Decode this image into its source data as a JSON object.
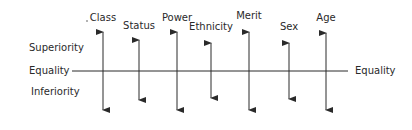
{
  "diagram": {
    "axis": {
      "left_labels": {
        "superiority": "Superiority",
        "equality": "Equality",
        "inferiority": "Inferiority"
      },
      "right_label": "Equality"
    },
    "dimensions": [
      {
        "label": "Class",
        "x": 103,
        "label_y": 12,
        "top": 32,
        "bottom": 110
      },
      {
        "label": "Status",
        "x": 139,
        "label_y": 20,
        "top": 40,
        "bottom": 100
      },
      {
        "label": "Power",
        "x": 177,
        "label_y": 12,
        "top": 32,
        "bottom": 110
      },
      {
        "label": "Ethnicity",
        "x": 211,
        "label_y": 21,
        "top": 43,
        "bottom": 98
      },
      {
        "label": "Merit",
        "x": 249,
        "label_y": 10,
        "top": 32,
        "bottom": 110
      },
      {
        "label": "Sex",
        "x": 289,
        "label_y": 21,
        "top": 43,
        "bottom": 99
      },
      {
        "label": "Age",
        "x": 326,
        "label_y": 12,
        "top": 33,
        "bottom": 110
      }
    ],
    "colors": {
      "ink": "#2a2a2a",
      "background": "#ffffff"
    }
  }
}
